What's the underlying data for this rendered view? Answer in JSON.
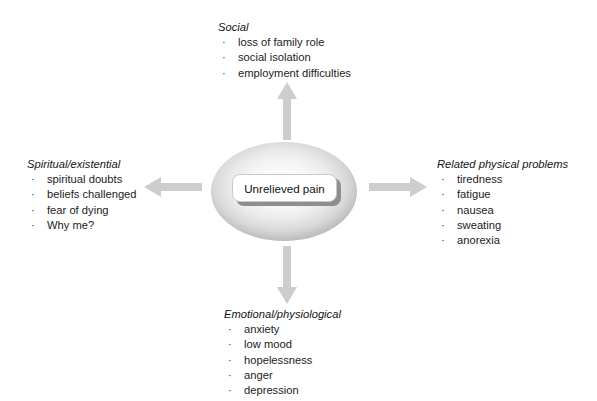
{
  "diagram": {
    "center": {
      "label": "Unrelieved pain",
      "shape": "ellipse",
      "fill_edge_color": "#ababab",
      "fill_center_color": "#fdfdfd",
      "label_box_color": "#ffffff"
    },
    "arrow_color": "#cccccc",
    "bullet_glyph": "·",
    "branches": [
      {
        "id": "social",
        "title": "Social",
        "position": "top",
        "arrow": "arrow-up-icon",
        "items": [
          "loss of family role",
          "social isolation",
          "employment difficulties"
        ]
      },
      {
        "id": "spiritual",
        "title": "Spiritual/existential",
        "position": "left",
        "arrow": "arrow-left-icon",
        "items": [
          "spiritual doubts",
          "beliefs challenged",
          "fear of dying",
          "Why me?"
        ]
      },
      {
        "id": "physical",
        "title": "Related physical problems",
        "position": "right",
        "arrow": "arrow-right-icon",
        "items": [
          "tiredness",
          "fatigue",
          "nausea",
          "sweating",
          "anorexia"
        ]
      },
      {
        "id": "emotional",
        "title": "Emotional/physiological",
        "position": "bottom",
        "arrow": "arrow-down-icon",
        "items": [
          "anxiety",
          "low mood",
          "hopelessness",
          "anger",
          "depression"
        ]
      }
    ]
  }
}
